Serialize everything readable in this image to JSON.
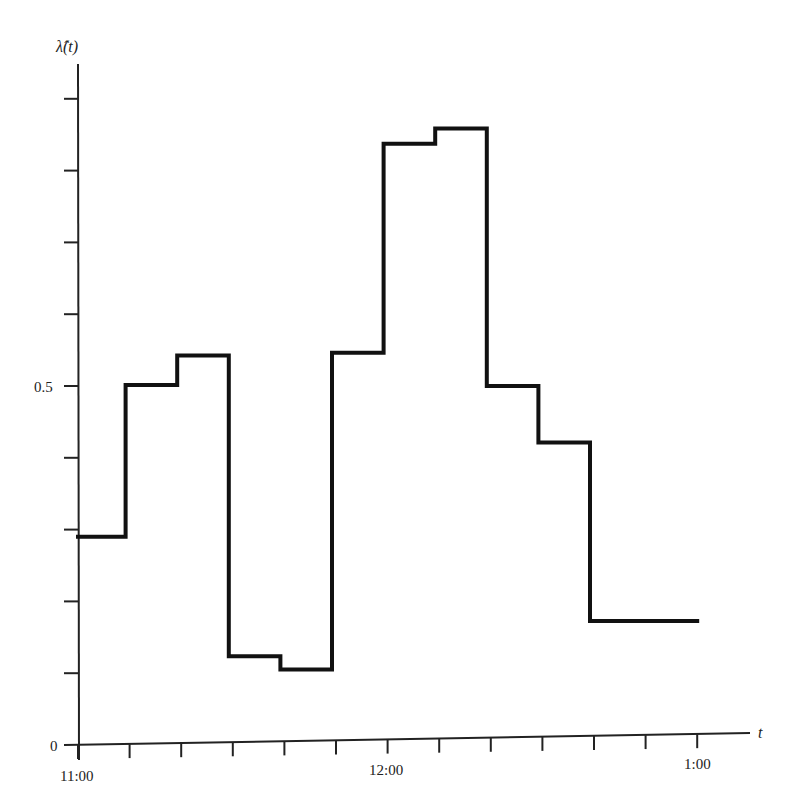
{
  "chart_data": {
    "type": "line",
    "subtype": "step",
    "title": "",
    "xlabel": "t",
    "ylabel": "λ̂(t)",
    "x_tick_labels": [
      {
        "label": "11:00",
        "minutes": 0
      },
      {
        "label": "12:00",
        "minutes": 60
      },
      {
        "label": "1:00",
        "minutes": 120
      }
    ],
    "x_minor_tick_interval_minutes": 10,
    "x_tick_count": 13,
    "y_tick_labels": [
      {
        "label": "0",
        "value": 0
      },
      {
        "label": "0.5",
        "value": 0.5
      }
    ],
    "y_minor_tick_interval": 0.1,
    "y_tick_values": [
      0,
      0.1,
      0.2,
      0.3,
      0.4,
      0.5,
      0.6,
      0.7,
      0.8,
      0.9
    ],
    "xlim_minutes": [
      0,
      130
    ],
    "ylim": [
      0,
      0.95
    ],
    "grid": false,
    "legend": null,
    "series": [
      {
        "name": "λ̂(t)",
        "color": "#111111",
        "steps": [
          {
            "start": "11:00",
            "end": "11:10",
            "start_min": 0,
            "end_min": 10,
            "value": 0.29
          },
          {
            "start": "11:10",
            "end": "11:20",
            "start_min": 10,
            "end_min": 20,
            "value": 0.5
          },
          {
            "start": "11:20",
            "end": "11:30",
            "start_min": 20,
            "end_min": 30,
            "value": 0.54
          },
          {
            "start": "11:30",
            "end": "11:40",
            "start_min": 30,
            "end_min": 40,
            "value": 0.12
          },
          {
            "start": "11:40",
            "end": "11:50",
            "start_min": 40,
            "end_min": 50,
            "value": 0.1
          },
          {
            "start": "11:50",
            "end": "12:00",
            "start_min": 50,
            "end_min": 60,
            "value": 0.54
          },
          {
            "start": "12:00",
            "end": "12:10",
            "start_min": 60,
            "end_min": 70,
            "value": 0.83
          },
          {
            "start": "12:10",
            "end": "12:20",
            "start_min": 70,
            "end_min": 80,
            "value": 0.85
          },
          {
            "start": "12:20",
            "end": "12:30",
            "start_min": 80,
            "end_min": 90,
            "value": 0.49
          },
          {
            "start": "12:30",
            "end": "12:40",
            "start_min": 90,
            "end_min": 100,
            "value": 0.41
          },
          {
            "start": "12:40",
            "end": "1:00",
            "start_min": 100,
            "end_min": 120,
            "value": 0.16
          }
        ]
      }
    ]
  },
  "labels": {
    "y_axis": "λ̂(t)",
    "x_axis": "t",
    "x_ticks": [
      "11:00",
      "12:00",
      "1:00"
    ],
    "y_ticks": [
      "0",
      "0.5"
    ]
  },
  "colors": {
    "line": "#111111",
    "axis": "#222222",
    "background": "#ffffff"
  }
}
